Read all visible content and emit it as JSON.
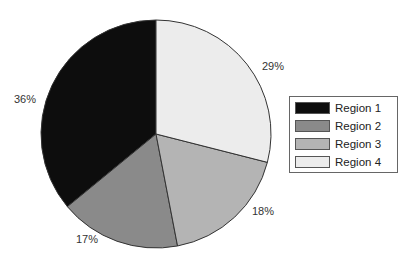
{
  "chart_data": {
    "type": "pie",
    "title": "",
    "categories": [
      "Region 1",
      "Region 2",
      "Region 3",
      "Region 4"
    ],
    "values": [
      36,
      17,
      18,
      29
    ],
    "labels": [
      "36%",
      "17%",
      "18%",
      "29%"
    ],
    "colors": [
      "#0d0d0d",
      "#8a8a8a",
      "#b4b4b4",
      "#ececec"
    ],
    "start_angle_deg": 90,
    "direction": "counterclockwise",
    "legend_position": "right"
  },
  "legend": {
    "items": [
      {
        "label": "Region 1",
        "color": "#0d0d0d"
      },
      {
        "label": "Region 2",
        "color": "#8a8a8a"
      },
      {
        "label": "Region 3",
        "color": "#b4b4b4"
      },
      {
        "label": "Region 4",
        "color": "#ececec"
      }
    ]
  },
  "slice_labels": {
    "r1": "36%",
    "r2": "17%",
    "r3": "18%",
    "r4": "29%"
  }
}
